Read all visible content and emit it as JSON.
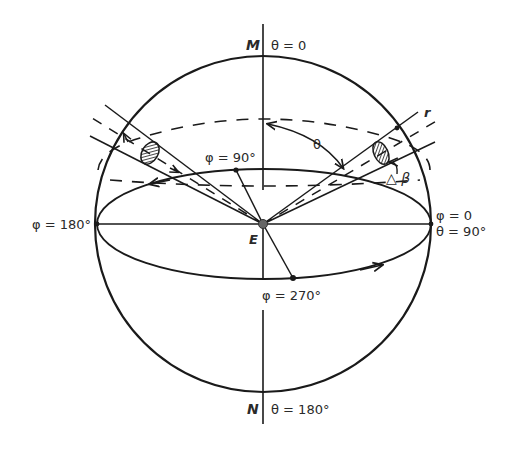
{
  "labels": {
    "pole_top": "M",
    "theta_top": "θ = 0",
    "pole_bottom": "N",
    "theta_bottom": "θ = 180°",
    "center": "E",
    "phi_left": "φ = 180°",
    "phi_right": "φ = 0",
    "theta_right": "θ = 90°",
    "phi_back": "φ = 90°",
    "phi_front": "φ = 270°",
    "theta_angle": "θ",
    "delta_beta": "△ β",
    "radius": "r"
  },
  "colors": {
    "stroke": "#1a1a1a",
    "text": "#2a2a2a",
    "center_dot": "#666666",
    "background": "#ffffff"
  }
}
